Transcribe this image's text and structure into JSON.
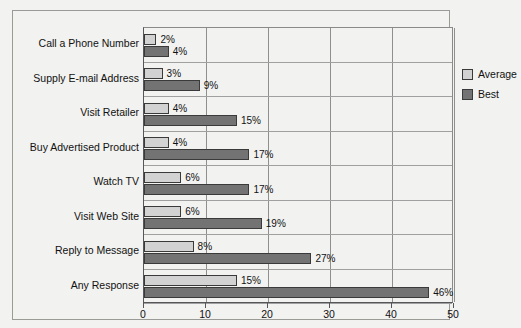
{
  "chart_data": {
    "type": "bar",
    "orientation": "horizontal",
    "title": "",
    "xlabel": "",
    "ylabel": "",
    "xlim": [
      0,
      50
    ],
    "xticks": [
      0,
      10,
      20,
      30,
      40,
      50
    ],
    "xtick_labels": [
      "0",
      "10",
      "20",
      "30",
      "40",
      "50"
    ],
    "grid": true,
    "grid_axis": "x",
    "legend_position": "upper right inside plot",
    "categories": [
      "Call a Phone Number",
      "Supply E-mail Address",
      "Visit Retailer",
      "Buy Advertised Product",
      "Watch TV",
      "Visit Web Site",
      "Reply to Message",
      "Any Response"
    ],
    "series": [
      {
        "name": "Average",
        "color": "#d2d2d2",
        "values": [
          2,
          3,
          4,
          4,
          6,
          6,
          8,
          15
        ],
        "value_labels": [
          "2%",
          "3%",
          "4%",
          "4%",
          "6%",
          "6%",
          "8%",
          "15%"
        ]
      },
      {
        "name": "Best",
        "color": "#737373",
        "values": [
          4,
          9,
          15,
          17,
          17,
          19,
          27,
          46
        ],
        "value_labels": [
          "4%",
          "9%",
          "15%",
          "17%",
          "17%",
          "19%",
          "27%",
          "46%"
        ]
      }
    ]
  },
  "legend": {
    "items": [
      {
        "label": "Average",
        "swatch": "average"
      },
      {
        "label": "Best",
        "swatch": "best"
      }
    ]
  },
  "colors": {
    "average": "#d2d2d2",
    "best": "#737373",
    "background": "#f2f2f0",
    "axis": "#55555a",
    "grid": "#8f8f8d",
    "bar_border": "#3a3a3a",
    "text": "#111111"
  }
}
